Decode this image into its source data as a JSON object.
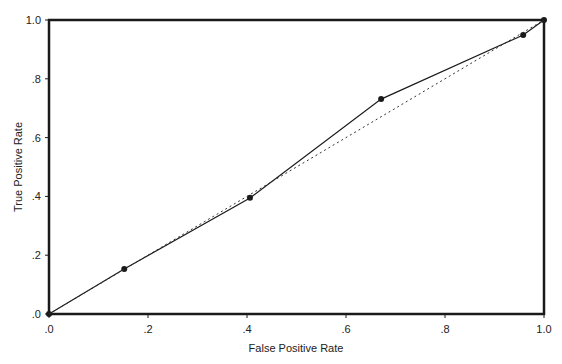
{
  "chart_data": {
    "type": "line",
    "title": "",
    "xlabel": "False Positive Rate",
    "ylabel": "True Positive Rate",
    "xlim": [
      0,
      1
    ],
    "ylim": [
      0,
      1
    ],
    "grid": false,
    "legend": null,
    "x_ticks": [
      ".0",
      ".2",
      ".4",
      ".6",
      ".8",
      "1.0"
    ],
    "y_ticks": [
      ".0",
      ".2",
      ".4",
      ".6",
      ".8",
      "1.0"
    ],
    "series": [
      {
        "name": "ROC curve",
        "style": "solid with markers",
        "x": [
          0.0,
          0.152,
          0.406,
          0.671,
          0.958,
          1.0
        ],
        "y": [
          0.0,
          0.153,
          0.395,
          0.731,
          0.949,
          1.0
        ]
      },
      {
        "name": "Reference line",
        "style": "dotted",
        "x": [
          0.0,
          1.0
        ],
        "y": [
          0.0,
          1.0
        ]
      }
    ]
  },
  "colors": {
    "axis": "#1a1a1a",
    "curve": "#1a1a1a",
    "reference": "#333333"
  }
}
